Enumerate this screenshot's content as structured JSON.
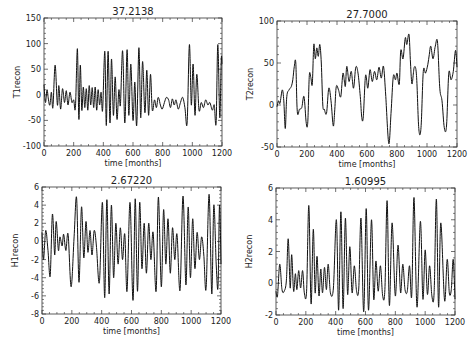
{
  "chart_data": [
    {
      "type": "line",
      "title": "37.2138",
      "xlabel": "time [months]",
      "ylabel": "T1recon",
      "xlim": [
        0,
        1200
      ],
      "ylim": [
        -100,
        150
      ],
      "xticks": [
        0,
        200,
        400,
        600,
        800,
        1000,
        1200
      ],
      "yticks": [
        -100,
        -50,
        0,
        50,
        100,
        150
      ],
      "box": [
        44,
        18,
        222,
        146
      ],
      "series": [
        {
          "name": "T1recon",
          "x": [
            0,
            10,
            20,
            30,
            40,
            50,
            60,
            75,
            90,
            100,
            112,
            125,
            138,
            150,
            162,
            175,
            188,
            200,
            212,
            225,
            235,
            245,
            255,
            265,
            275,
            285,
            295,
            305,
            315,
            325,
            335,
            345,
            355,
            365,
            375,
            385,
            395,
            410,
            420,
            432,
            445,
            455,
            468,
            480,
            492,
            505,
            515,
            530,
            545,
            560,
            572,
            585,
            600,
            612,
            625,
            640,
            652,
            665,
            680,
            693,
            705,
            718,
            730,
            745,
            758,
            770,
            785,
            797,
            812,
            825,
            840,
            853,
            865,
            878,
            890,
            905,
            920,
            935,
            950,
            965,
            980,
            993,
            1005,
            1018,
            1030,
            1045,
            1060,
            1075,
            1090,
            1105,
            1118,
            1135,
            1148,
            1160,
            1172,
            1185,
            1195,
            1200
          ],
          "y": [
            20,
            -15,
            10,
            -10,
            -20,
            5,
            -25,
            58,
            -20,
            18,
            -28,
            12,
            -15,
            8,
            -20,
            5,
            -15,
            -10,
            -25,
            90,
            -48,
            58,
            -30,
            15,
            -25,
            12,
            -30,
            18,
            -20,
            14,
            -25,
            15,
            -30,
            10,
            -20,
            5,
            -30,
            85,
            -60,
            85,
            -55,
            70,
            -40,
            35,
            -48,
            10,
            -20,
            86,
            -55,
            88,
            -40,
            60,
            -50,
            25,
            -60,
            92,
            -45,
            65,
            -35,
            48,
            -40,
            40,
            -30,
            -10,
            -25,
            -5,
            -20,
            -28,
            -15,
            -5,
            -10,
            -25,
            -8,
            -20,
            -10,
            -28,
            -15,
            -5,
            -25,
            -55,
            98,
            -20,
            60,
            -40,
            40,
            -30,
            -15,
            -25,
            -10,
            -20,
            -15,
            -30,
            -20,
            -55,
            98,
            -45,
            70,
            60
          ]
        }
      ]
    },
    {
      "type": "line",
      "title": "27.7000",
      "xlabel": "time [months]",
      "ylabel": "T2recon",
      "xlim": [
        0,
        1200
      ],
      "ylim": [
        -50,
        100
      ],
      "xticks": [
        0,
        200,
        400,
        600,
        800,
        1000,
        1200
      ],
      "yticks": [
        -50,
        0,
        50,
        100
      ],
      "box": [
        277,
        21,
        457,
        147
      ],
      "series": [
        {
          "name": "T2recon",
          "x": [
            0,
            10,
            20,
            35,
            45,
            55,
            65,
            80,
            95,
            105,
            115,
            125,
            135,
            150,
            165,
            180,
            195,
            205,
            215,
            225,
            235,
            245,
            255,
            265,
            275,
            285,
            295,
            305,
            315,
            330,
            345,
            360,
            375,
            385,
            395,
            410,
            425,
            440,
            455,
            465,
            480,
            495,
            510,
            525,
            540,
            555,
            565,
            575,
            590,
            605,
            620,
            635,
            650,
            665,
            680,
            695,
            710,
            725,
            745,
            760,
            775,
            790,
            800,
            815,
            825,
            840,
            855,
            865,
            880,
            890,
            900,
            915,
            930,
            945,
            960,
            975,
            990,
            1005,
            1015,
            1025,
            1040,
            1055,
            1070,
            1085,
            1100,
            1115,
            1130,
            1145,
            1160,
            1175,
            1190,
            1200
          ],
          "y": [
            -2,
            5,
            2,
            18,
            5,
            -28,
            10,
            18,
            22,
            30,
            46,
            50,
            -8,
            -5,
            -3,
            10,
            -22,
            -20,
            35,
            33,
            25,
            72,
            55,
            68,
            58,
            72,
            50,
            0,
            -5,
            -10,
            20,
            5,
            -25,
            -5,
            22,
            18,
            10,
            38,
            22,
            46,
            28,
            40,
            20,
            45,
            38,
            10,
            -15,
            -14,
            35,
            20,
            42,
            28,
            40,
            30,
            45,
            32,
            46,
            10,
            -46,
            -10,
            34,
            30,
            38,
            25,
            65,
            55,
            80,
            72,
            84,
            50,
            25,
            45,
            35,
            -28,
            -27,
            40,
            38,
            48,
            60,
            70,
            55,
            70,
            75,
            20,
            5,
            -27,
            -25,
            38,
            30,
            40,
            65,
            45,
            55
          ]
        }
      ]
    },
    {
      "type": "line",
      "title": "2.67220",
      "xlabel": "time [months]",
      "ylabel": "H1recon",
      "xlim": [
        0,
        1200
      ],
      "ylim": [
        -8,
        6
      ],
      "xticks": [
        0,
        200,
        400,
        600,
        800,
        1000,
        1200
      ],
      "yticks": [
        -8,
        -6,
        -4,
        -2,
        0,
        2,
        4,
        6
      ],
      "box": [
        42,
        187,
        221,
        314
      ],
      "series": [
        {
          "name": "H1recon",
          "x": [
            0,
            10,
            25,
            40,
            55,
            70,
            85,
            95,
            110,
            120,
            135,
            145,
            160,
            175,
            195,
            215,
            232,
            248,
            265,
            280,
            295,
            308,
            322,
            335,
            350,
            365,
            385,
            405,
            420,
            435,
            450,
            465,
            480,
            495,
            510,
            525,
            540,
            555,
            570,
            590,
            610,
            625,
            640,
            655,
            670,
            685,
            700,
            715,
            730,
            745,
            765,
            780,
            800,
            815,
            830,
            845,
            860,
            875,
            890,
            905,
            925,
            945,
            965,
            980,
            995,
            1010,
            1025,
            1040,
            1055,
            1070,
            1085,
            1100,
            1120,
            1138,
            1152,
            1168,
            1180,
            1190,
            1200
          ],
          "y": [
            1,
            -2,
            1.2,
            -1,
            -3.8,
            3,
            -1.5,
            2.2,
            -1,
            0.5,
            -0.5,
            0.8,
            -1,
            0.8,
            -5,
            0.5,
            4.8,
            -4.5,
            3.8,
            -1.8,
            2.2,
            -1.2,
            1.2,
            -1.5,
            1.2,
            -0.5,
            -4.5,
            4.3,
            -6.2,
            4.6,
            -5.8,
            4,
            -4,
            2,
            -2.5,
            1.5,
            -2,
            0.8,
            -5.5,
            4.3,
            -6.5,
            4.7,
            -5.5,
            4.3,
            -3,
            2,
            -3.5,
            2,
            -2,
            1,
            -5.5,
            4.9,
            -5,
            3.5,
            -2.5,
            2.5,
            -3.5,
            1.5,
            -2,
            0.8,
            -5.4,
            5,
            -4.8,
            3.8,
            -4,
            2.5,
            -3,
            1,
            -2,
            0.5,
            -1.5,
            -5.2,
            5.2,
            -5.8,
            4,
            -2.5,
            -5,
            4,
            -2.5
          ]
        }
      ]
    },
    {
      "type": "line",
      "title": "1.60995",
      "xlabel": "time [months]",
      "ylabel": "H2recon",
      "xlim": [
        0,
        1200
      ],
      "ylim": [
        -2,
        6
      ],
      "xticks": [
        0,
        200,
        400,
        600,
        800,
        1000,
        1200
      ],
      "yticks": [
        -2,
        0,
        2,
        4,
        6
      ],
      "box": [
        276,
        188,
        455,
        315
      ],
      "series": [
        {
          "name": "H2recon",
          "x": [
            0,
            10,
            25,
            40,
            55,
            70,
            82,
            95,
            105,
            118,
            130,
            140,
            152,
            165,
            178,
            190,
            205,
            220,
            235,
            250,
            262,
            275,
            288,
            300,
            312,
            325,
            338,
            350,
            365,
            385,
            405,
            420,
            435,
            450,
            465,
            480,
            495,
            510,
            525,
            540,
            555,
            570,
            588,
            605,
            620,
            640,
            655,
            670,
            685,
            700,
            715,
            730,
            745,
            760,
            778,
            800,
            818,
            835,
            850,
            865,
            880,
            895,
            910,
            925,
            945,
            968,
            985,
            1000,
            1015,
            1030,
            1045,
            1060,
            1075,
            1090,
            1105,
            1130,
            1148,
            1162,
            1175,
            1188,
            1200
          ],
          "y": [
            -0.5,
            -0.8,
            1.2,
            -0.4,
            -0.5,
            0.2,
            2.8,
            -0.3,
            1.8,
            -0.5,
            0.6,
            -0.4,
            0.8,
            -0.3,
            0.8,
            -0.6,
            -0.5,
            4.9,
            -1.3,
            3.4,
            -0.6,
            1.7,
            -0.8,
            0.9,
            -0.6,
            1,
            -0.4,
            1.2,
            -0.6,
            -0.3,
            4,
            -1.7,
            4.5,
            -1.6,
            4.1,
            -0.7,
            2.3,
            -0.6,
            1.1,
            -0.5,
            -0.3,
            4.1,
            -1.8,
            4.7,
            -1.7,
            4,
            -1,
            1.4,
            -0.5,
            1.1,
            -0.8,
            -0.4,
            5.2,
            -1.4,
            3.8,
            -0.8,
            2.4,
            -0.6,
            1.2,
            -0.4,
            -0.5,
            1.1,
            -0.8,
            5.4,
            -1.5,
            3.9,
            -1,
            2.1,
            -0.7,
            1.1,
            -0.8,
            -0.6,
            5.3,
            -1.5,
            3.8,
            -1.1,
            1.5,
            -0.6,
            -0.4,
            1.5,
            -1
          ]
        }
      ]
    }
  ]
}
